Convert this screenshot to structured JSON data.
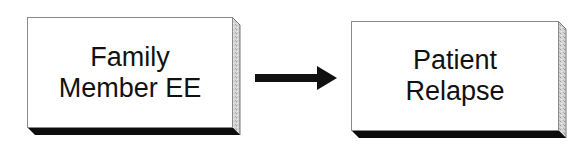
{
  "diagram": {
    "type": "flow",
    "nodes": [
      {
        "id": "family_member_ee",
        "lines": [
          "Family",
          "Member EE"
        ]
      },
      {
        "id": "patient_relapse",
        "lines": [
          "Patient",
          "Relapse"
        ]
      }
    ],
    "edges": [
      {
        "from": "family_member_ee",
        "to": "patient_relapse",
        "style": "solid-arrow"
      }
    ],
    "colors": {
      "box_fill": "#ffffff",
      "shadow": "#0d0d0d",
      "arrow": "#111111",
      "text": "#111111"
    }
  }
}
